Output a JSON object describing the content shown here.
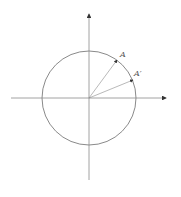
{
  "diagram": {
    "type": "unit-circle-rotation",
    "labels": {
      "point_a": "A",
      "point_a_prime": "A′"
    },
    "colors": {
      "circle": "#8a8a8a",
      "axes": "#8a8a8a",
      "vectors": "#8a8a8a",
      "arrowheads": "#333333",
      "text": "#555555"
    }
  }
}
